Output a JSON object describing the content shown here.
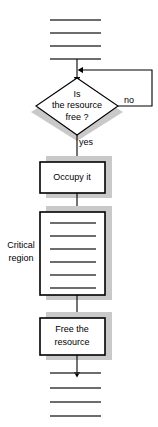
{
  "diagram": {
    "colors": {
      "shadow": "#c9c9c9",
      "stroke": "#000000",
      "code_line": "#3d3d3d",
      "background": "#ffffff"
    },
    "nodes": {
      "decision": {
        "name": "is-the-resource-free-decision",
        "line1": "Is",
        "line2": "the resource",
        "line3": "free ?"
      },
      "occupy": {
        "name": "occupy-it-process",
        "line1": "Occupy it"
      },
      "critical_region": {
        "name": "critical-region-process",
        "label_line1": "Critical",
        "label_line2": "region",
        "statement_count": 6
      },
      "free": {
        "name": "free-the-resource-process",
        "line1": "Free the",
        "line2": "resource"
      }
    },
    "edge_labels": {
      "no": "no",
      "yes": "yes"
    },
    "code_blocks": {
      "top": {
        "name": "preceding-statements",
        "line_count": 4
      },
      "bottom": {
        "name": "following-statements",
        "line_count": 4
      }
    }
  }
}
